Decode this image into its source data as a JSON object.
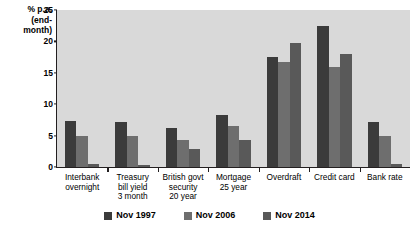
{
  "chart_data": {
    "type": "bar",
    "title": "",
    "xlabel": "",
    "ylabel": "% p.a. (end-month)",
    "ylabel_lines": "% p.a.\n(end-\nmonth)",
    "ylim": [
      0,
      25
    ],
    "yticks": [
      0,
      5,
      10,
      15,
      20,
      25
    ],
    "grid": false,
    "legend_position": "bottom",
    "categories": [
      "Interbank\novernight",
      "Treasury\nbill yield\n3 month",
      "British govt\nsecurity\n20 year",
      "Mortgage\n25 year",
      "Overdraft",
      "Credit card",
      "Bank rate"
    ],
    "series": [
      {
        "name": "Nov 1997",
        "color": "#3b3b3b",
        "values": [
          7.3,
          7.1,
          6.2,
          8.3,
          17.5,
          22.5,
          7.2
        ]
      },
      {
        "name": "Nov 2006",
        "color": "#6e6e6e",
        "values": [
          5.0,
          5.0,
          4.3,
          6.5,
          16.7,
          16.0,
          5.0
        ]
      },
      {
        "name": "Nov 2014",
        "color": "#595959",
        "values": [
          0.45,
          0.4,
          2.9,
          4.3,
          19.7,
          18.0,
          0.5
        ]
      }
    ]
  },
  "colors": {
    "plot_background": "#d9d9d9",
    "axis": "#231f20",
    "page_background": "#ffffff"
  }
}
